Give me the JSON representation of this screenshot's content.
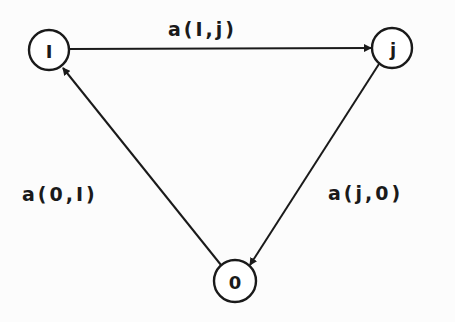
{
  "diagram": {
    "type": "directed-graph",
    "nodes": [
      {
        "id": "i",
        "label": "I",
        "cx": 49,
        "cy": 50,
        "r": 20
      },
      {
        "id": "j",
        "label": "j",
        "cx": 392,
        "cy": 48,
        "r": 20
      },
      {
        "id": "0",
        "label": "0",
        "cx": 235,
        "cy": 281,
        "r": 21
      }
    ],
    "edges": [
      {
        "from": "i",
        "to": "j",
        "label": "a(I,j)"
      },
      {
        "from": "j",
        "to": "0",
        "label": "a(j,0)"
      },
      {
        "from": "0",
        "to": "i",
        "label": "a(0,I)"
      }
    ],
    "colors": {
      "stroke": "#1a1a1a",
      "background": "#fcfcfc"
    }
  }
}
